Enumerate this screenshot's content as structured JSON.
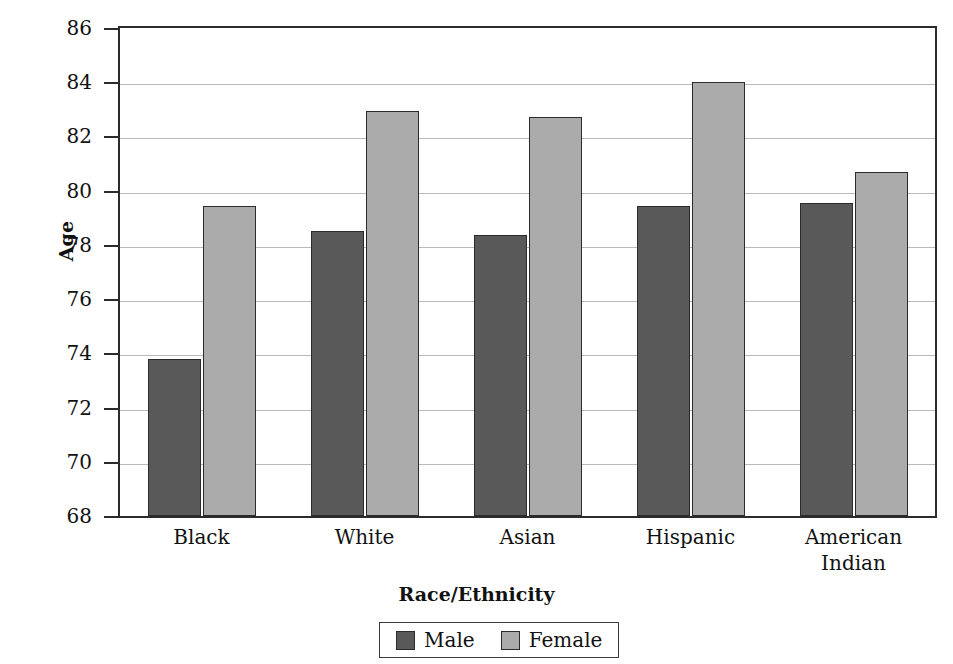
{
  "chart_data": {
    "type": "bar",
    "title": "",
    "xlabel": "Race/Ethnicity",
    "ylabel": "Age",
    "ylim": [
      68,
      86
    ],
    "ytick_step": 2,
    "yticks": [
      86,
      84,
      82,
      80,
      78,
      76,
      74,
      72,
      70,
      68
    ],
    "grid": true,
    "legend_position": "bottom-center",
    "categories": [
      "Black",
      "White",
      "Asian",
      "Hispanic",
      "American Indian"
    ],
    "category_lines": [
      [
        "Black"
      ],
      [
        "White"
      ],
      [
        "Asian"
      ],
      [
        "Hispanic"
      ],
      [
        "American",
        "Indian"
      ]
    ],
    "series": [
      {
        "name": "Male",
        "color": "#595959",
        "values": [
          73.8,
          78.5,
          78.35,
          79.45,
          79.55
        ]
      },
      {
        "name": "Female",
        "color": "#ababab",
        "values": [
          79.45,
          82.95,
          82.7,
          84.0,
          80.7
        ]
      }
    ]
  },
  "legend": {
    "entries": [
      {
        "label": "Male",
        "color": "#595959"
      },
      {
        "label": "Female",
        "color": "#ababab"
      }
    ]
  },
  "colors": {
    "male_bar": "#595959",
    "female_bar": "#ababab",
    "axis": "#2b2b2b",
    "gridline": "#b9b9b9",
    "background": "#ffffff"
  }
}
